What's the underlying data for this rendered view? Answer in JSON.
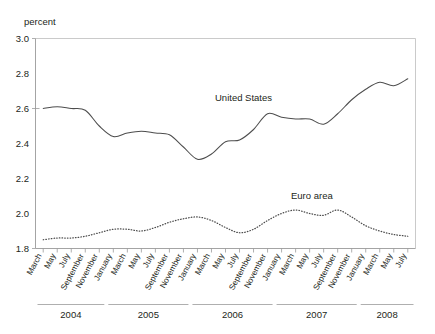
{
  "figure": {
    "y_axis_title": "percent",
    "series_labels": {
      "united_states": "United States",
      "euro_area": "Euro area"
    },
    "y_ticks": [
      "3.0",
      "2.8",
      "2.6",
      "2.4",
      "2.2",
      "2.0",
      "1.8"
    ],
    "year_groups": [
      "2004",
      "2005",
      "2006",
      "2007",
      "2008"
    ],
    "month_ticks": [
      "March",
      "May",
      "July",
      "September",
      "November",
      "January",
      "March",
      "May",
      "July",
      "September",
      "November",
      "January",
      "March",
      "May",
      "July",
      "September",
      "November",
      "January",
      "March",
      "May",
      "July",
      "September",
      "November",
      "January",
      "March",
      "May",
      "July"
    ]
  },
  "chart_data": {
    "type": "line",
    "title": "",
    "xlabel": "",
    "ylabel": "percent",
    "ylim": [
      1.8,
      3.0
    ],
    "grid": false,
    "legend": "inline-annotation",
    "x": [
      "2004-03",
      "2004-05",
      "2004-07",
      "2004-09",
      "2004-11",
      "2005-01",
      "2005-03",
      "2005-05",
      "2005-07",
      "2005-09",
      "2005-11",
      "2006-01",
      "2006-03",
      "2006-05",
      "2006-07",
      "2006-09",
      "2006-11",
      "2007-01",
      "2007-03",
      "2007-05",
      "2007-07",
      "2007-09",
      "2007-11",
      "2008-01",
      "2008-03",
      "2008-05",
      "2008-07"
    ],
    "series": [
      {
        "name": "United States",
        "style": "solid",
        "values": [
          2.6,
          2.61,
          2.6,
          2.59,
          2.5,
          2.44,
          2.46,
          2.47,
          2.46,
          2.45,
          2.38,
          2.31,
          2.34,
          2.41,
          2.42,
          2.48,
          2.57,
          2.55,
          2.54,
          2.54,
          2.51,
          2.57,
          2.65,
          2.71,
          2.75,
          2.73,
          2.77
        ]
      },
      {
        "name": "Euro area",
        "style": "dotted",
        "values": [
          1.85,
          1.86,
          1.86,
          1.87,
          1.89,
          1.91,
          1.91,
          1.9,
          1.92,
          1.95,
          1.97,
          1.98,
          1.96,
          1.92,
          1.89,
          1.91,
          1.96,
          2.0,
          2.02,
          2.0,
          1.99,
          2.02,
          1.98,
          1.93,
          1.9,
          1.88,
          1.87
        ]
      }
    ],
    "annotations": [
      {
        "text": "United States",
        "x": "2006-03",
        "y": 2.63
      },
      {
        "text": "Euro area",
        "x": "2007-07",
        "y": 2.04
      }
    ]
  }
}
